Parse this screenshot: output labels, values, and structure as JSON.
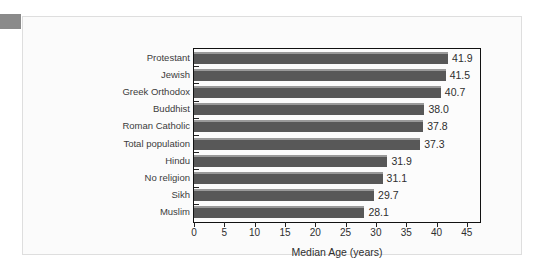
{
  "chart_data": {
    "type": "bar",
    "orientation": "horizontal",
    "title": "",
    "xlabel": "Median Age (years)",
    "ylabel": "",
    "xlim": [
      0,
      47
    ],
    "xticks": [
      0,
      5,
      10,
      15,
      20,
      25,
      30,
      35,
      40,
      45
    ],
    "grid": false,
    "legend": null,
    "categories": [
      "Protestant",
      "Jewish",
      "Greek Orthodox",
      "Buddhist",
      "Roman Catholic",
      "Total population",
      "Hindu",
      "No religion",
      "Sikh",
      "Muslim"
    ],
    "values": [
      41.9,
      41.5,
      40.7,
      38.0,
      37.8,
      37.3,
      31.9,
      31.1,
      29.7,
      28.1
    ],
    "value_labels": [
      "41.9",
      "41.5",
      "40.7",
      "38.0",
      "37.8",
      "37.3",
      "31.9",
      "31.1",
      "29.7",
      "28.1"
    ],
    "tick_labels": [
      "0",
      "5",
      "10",
      "15",
      "20",
      "25",
      "30",
      "35",
      "40",
      "45"
    ],
    "colors": {
      "bar": "#585858",
      "bar_highlight": "#9a9a9a",
      "frame": "#111111",
      "panel_background": "#fbfbfb",
      "panel_border": "#dedede",
      "text": "#2e2e2e",
      "edge_tab": "#8a8a8a"
    }
  }
}
